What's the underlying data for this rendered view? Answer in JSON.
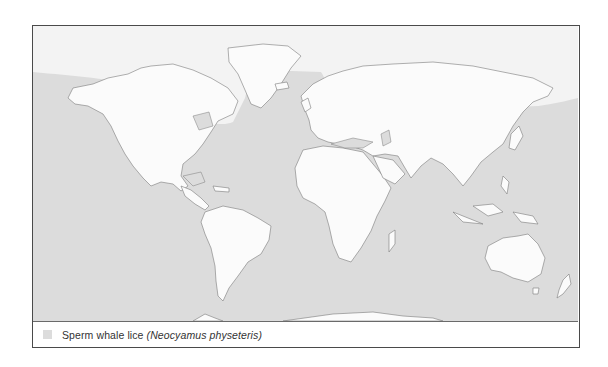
{
  "map": {
    "projection": "world equirectangular",
    "colors": {
      "range_fill": "#dcdcdc",
      "non_range_fill": "#f3f3f3",
      "land_fill": "#fbfbfb",
      "coastline": "#7a7a7a",
      "frame": "#4a4a4a"
    },
    "regions": [
      {
        "name": "range",
        "description": "Oceans worldwide (shaded), excluding Arctic waters"
      },
      {
        "name": "non-range",
        "description": "Arctic Ocean and northernmost seas (unshaded)"
      }
    ]
  },
  "legend": {
    "items": [
      {
        "swatch_color": "#dcdcdc",
        "label": "Sperm whale lice",
        "scientific_name": "(Neocyamus physeteris)"
      }
    ]
  }
}
